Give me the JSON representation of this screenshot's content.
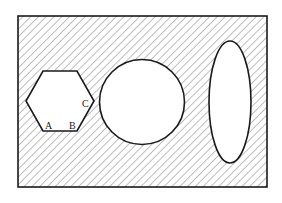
{
  "diagram": {
    "type": "venn-style set diagram",
    "colors": {
      "stroke": "#1a1a1a",
      "hatch": "#8a8a8a",
      "background": "#ffffff",
      "shape_fill": "#ffffff"
    },
    "shapes": [
      {
        "name": "hexagon",
        "fill": "white"
      },
      {
        "name": "circle",
        "fill": "white"
      },
      {
        "name": "ellipse",
        "fill": "white"
      }
    ],
    "region_shading": "diagonal hatching outside shapes",
    "hexagon_labels": {
      "a": "A",
      "b": "B",
      "c": "C"
    }
  }
}
